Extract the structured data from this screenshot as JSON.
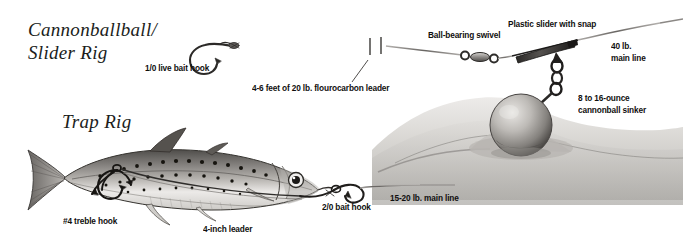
{
  "figure": {
    "kind": "fishing-rig-illustration",
    "style": "pen-and-ink engraving",
    "background_color": "#ffffff",
    "ink_color": "#1a1a1a"
  },
  "rigs": [
    {
      "id": "cannonball-slider-rig",
      "title": "Cannonballball/\nSlider Rig",
      "components": [
        "1/0 live bait hook",
        "4-6 feet of 20 lb. flourocarbon leader",
        "Ball-bearing swivel",
        "Plastic slider with snap",
        "40 lb. main line",
        "8 to 16-ounce cannonball sinker"
      ]
    },
    {
      "id": "trap-rig",
      "title": "Trap Rig",
      "components": [
        "#4 treble hook",
        "4-inch leader",
        "2/0 bait hook",
        "15-20 lb. main line"
      ]
    }
  ],
  "labels": {
    "live_bait_hook": "1/0 live bait hook",
    "leader": "4-6 feet of 20 lb. flourocarbon leader",
    "swivel": "Ball-bearing swivel",
    "slider": "Plastic slider with snap",
    "main_line_40": "40 lb.\nmain line",
    "sinker": "8 to 16-ounce\ncannonball sinker",
    "treble_hook": "#4 treble hook",
    "four_inch_leader": "4-inch leader",
    "bait_hook": "2/0 bait hook",
    "main_line_15_20": "15-20 lb. main line"
  },
  "colors": {
    "ink": "#1a1a1a",
    "label_text": "#100f0e",
    "title_text": "#201d1b",
    "seabed_light": "#e2e1df",
    "seabed_mid": "#c9c7c4",
    "seabed_dark": "#9c9a96",
    "sinker_light": "#d8d6d2",
    "sinker_dark": "#6b6865",
    "fish_back": "#6e6c69",
    "fish_belly": "#efeeec",
    "metal": "#8e8c89"
  }
}
